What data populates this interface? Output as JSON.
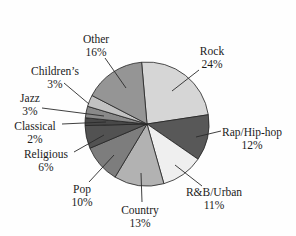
{
  "figure": {
    "kind": "pie-chart-figure",
    "background": "#fefefe",
    "text_color": "#1b1b1b",
    "line_color": "#2a2a2a"
  },
  "chart_data": {
    "type": "pie",
    "title": "",
    "unit": "%",
    "direction": "clockwise",
    "start_angle_deg": -5,
    "legend_position": "none",
    "labels_style": "outside-with-leader-lines",
    "categories": [
      "Rock",
      "Rap/Hip-hop",
      "R&B/Urban",
      "Country",
      "Pop",
      "Religious",
      "Classical",
      "Jazz",
      "Children’s",
      "Other"
    ],
    "values": [
      24,
      12,
      11,
      13,
      10,
      6,
      2,
      3,
      3,
      16
    ],
    "slices": [
      {
        "label": "Rock",
        "value": 24,
        "pct_text": "24%",
        "color": "#d6d6d6"
      },
      {
        "label": "Rap/Hip-hop",
        "value": 12,
        "pct_text": "12%",
        "color": "#585858"
      },
      {
        "label": "R&B/Urban",
        "value": 11,
        "pct_text": "11%",
        "color": "#efefef"
      },
      {
        "label": "Country",
        "value": 13,
        "pct_text": "13%",
        "color": "#b2b2b2"
      },
      {
        "label": "Pop",
        "value": 10,
        "pct_text": "10%",
        "color": "#7d7d7d"
      },
      {
        "label": "Religious",
        "value": 6,
        "pct_text": "6%",
        "color": "#525252"
      },
      {
        "label": "Classical",
        "value": 2,
        "pct_text": "2%",
        "color": "#484848"
      },
      {
        "label": "Jazz",
        "value": 3,
        "pct_text": "3%",
        "color": "#898989"
      },
      {
        "label": "Children’s",
        "value": 3,
        "pct_text": "3%",
        "color": "#c2c2c2"
      },
      {
        "label": "Other",
        "value": 16,
        "pct_text": "16%",
        "color": "#959595"
      }
    ],
    "label_layout": [
      {
        "text_x": 212,
        "line1_y": 55,
        "line2_y": 68,
        "lead": [
          199,
          70,
          172,
          91
        ]
      },
      {
        "text_x": 252,
        "line1_y": 136,
        "line2_y": 149,
        "lead": [
          221,
          131,
          196,
          137
        ]
      },
      {
        "text_x": 214,
        "line1_y": 196,
        "line2_y": 209,
        "lead": [
          202,
          186,
          175,
          165
        ]
      },
      {
        "text_x": 140,
        "line1_y": 214,
        "line2_y": 227,
        "lead": [
          142,
          202,
          141,
          173
        ]
      },
      {
        "text_x": 82,
        "line1_y": 193,
        "line2_y": 206,
        "lead": [
          89,
          182,
          114,
          155
        ]
      },
      {
        "text_x": 46,
        "line1_y": 158,
        "line2_y": 171,
        "lead": [
          74,
          152,
          104,
          135
        ]
      },
      {
        "text_x": 35,
        "line1_y": 130,
        "line2_y": 143,
        "lead": [
          62,
          124,
          106,
          122
        ]
      },
      {
        "text_x": 30,
        "line1_y": 102,
        "line2_y": 115,
        "lead": [
          42,
          108,
          104,
          116
        ]
      },
      {
        "text_x": 55,
        "line1_y": 75,
        "line2_y": 88,
        "lead": [
          64,
          83,
          89,
          104
        ]
      },
      {
        "text_x": 96,
        "line1_y": 43,
        "line2_y": 56,
        "lead": [
          105,
          58,
          126,
          88
        ]
      }
    ],
    "geometry": {
      "cx": 147,
      "cy": 124,
      "r": 62,
      "canvas_w": 296,
      "canvas_h": 236
    }
  }
}
